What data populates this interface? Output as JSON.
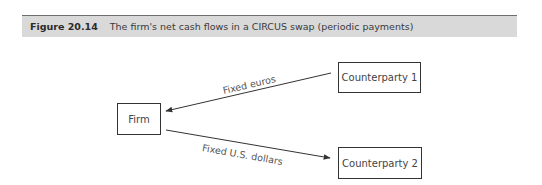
{
  "figure": {
    "number": "Figure 20.14",
    "caption": "The firm's net cash flows in a CIRCUS swap (periodic payments)"
  },
  "nodes": [
    {
      "id": "firm",
      "label": "Firm"
    },
    {
      "id": "cp1",
      "label": "Counterparty 1"
    },
    {
      "id": "cp2",
      "label": "Counterparty 2"
    }
  ],
  "edges": [
    {
      "from": "cp1",
      "to": "firm",
      "label": "Fixed euros"
    },
    {
      "from": "firm",
      "to": "cp2",
      "label": "Fixed U.S. dollars"
    }
  ],
  "colors": {
    "header_bg": "#d9d9d9",
    "line": "#333333",
    "text": "#444444"
  }
}
